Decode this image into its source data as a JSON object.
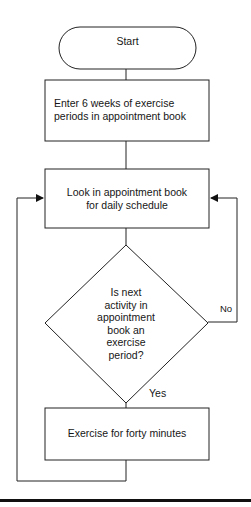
{
  "flowchart": {
    "start": {
      "label": "Start",
      "shape": "terminal"
    },
    "steps": [
      {
        "id": "enter",
        "label": "Enter 6 weeks of exercise periods in appointment book",
        "lines": [
          "Enter 6 weeks of exercise",
          "periods in appointment book"
        ],
        "shape": "process"
      },
      {
        "id": "look",
        "label": "Look in appointment book for daily schedule",
        "lines": [
          "Look in appointment book",
          "for daily schedule"
        ],
        "shape": "process"
      },
      {
        "id": "decision",
        "label": "Is next activity in appointment book an exercise period?",
        "lines": [
          "Is next",
          "activity in",
          "appointment",
          "book an",
          "exercise",
          "period?"
        ],
        "shape": "decision"
      },
      {
        "id": "exercise",
        "label": "Exercise for forty minutes",
        "lines": [
          "Exercise for forty minutes"
        ],
        "shape": "process"
      }
    ],
    "edges": [
      {
        "from": "start",
        "to": "enter",
        "label": ""
      },
      {
        "from": "enter",
        "to": "look",
        "label": ""
      },
      {
        "from": "look",
        "to": "decision",
        "label": ""
      },
      {
        "from": "decision",
        "to": "look",
        "label": "No"
      },
      {
        "from": "decision",
        "to": "exercise",
        "label": "Yes"
      },
      {
        "from": "exercise",
        "to": "look",
        "label": ""
      }
    ],
    "branch_labels": {
      "no": "No",
      "yes": "Yes"
    }
  },
  "colors": {
    "stroke": "#222222",
    "text": "#161616",
    "background": "#ffffff",
    "rule": "#111111"
  }
}
